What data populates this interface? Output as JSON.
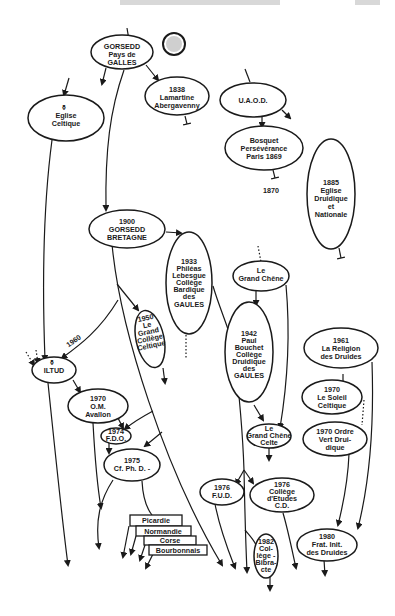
{
  "diagram": {
    "nodes": {
      "gorsedd_galles": {
        "lines": [
          "GORSEDD",
          "Pays de",
          "GALLES"
        ]
      },
      "lamartine": {
        "lines": [
          "1838",
          "Lamartine",
          "Abergavenny"
        ]
      },
      "uaod": {
        "lines": [
          "U.A.O.D."
        ]
      },
      "eglise_celtique": {
        "lines": [
          "Eglise",
          "Celtique"
        ],
        "symbol": "⚱"
      },
      "bosquet": {
        "lines": [
          "Bosquet",
          "Persévérance",
          "Paris 1869"
        ]
      },
      "label_1870": {
        "text": "1870"
      },
      "eglise_druidique": {
        "lines": [
          "1885",
          "Eglise",
          "Druidique",
          "et",
          "Nationale"
        ]
      },
      "gorsedd_bretagne": {
        "lines": [
          "1900",
          "GORSEDD",
          "BRETAGNE"
        ]
      },
      "phileas": {
        "lines": [
          "1933",
          "Philéas",
          "Lebesgue",
          "Collège",
          "Bardique",
          "des",
          "GAULES"
        ]
      },
      "grand_chene": {
        "lines": [
          "Le",
          "Grand Chêne"
        ]
      },
      "grand_college": {
        "lines": [
          "1950",
          "Le",
          "Grand",
          "Collège",
          "Celtique"
        ]
      },
      "label_1960": {
        "text": "1960"
      },
      "iltud": {
        "lines": [
          "ILTUD"
        ],
        "symbol": "⚱"
      },
      "paul_bouchet": {
        "lines": [
          "1942",
          "Paul",
          "Bouchet",
          "Collège",
          "Druidique",
          "des",
          "GAULES"
        ]
      },
      "religion_druides": {
        "lines": [
          "1961",
          "La Religion",
          "des Druides"
        ]
      },
      "om_avallon": {
        "lines": [
          "1970",
          "O.M.",
          "Avallon"
        ]
      },
      "soleil_celtique": {
        "lines": [
          "1970",
          "Le Soleil",
          "Celtique"
        ]
      },
      "fdo": {
        "lines": [
          "1974",
          "F.D.O."
        ]
      },
      "grand_chene_celte": {
        "lines": [
          "Le",
          "Grand Chêne",
          "Celte"
        ]
      },
      "ordre_vert": {
        "lines": [
          "1970 Ordre",
          "Vert Drui-",
          "dique"
        ]
      },
      "cf_ph_d": {
        "lines": [
          "1975",
          "Cf. Ph. D. -"
        ]
      },
      "fud": {
        "lines": [
          "1976",
          "F.U.D."
        ]
      },
      "college_etudes": {
        "lines": [
          "1976",
          "Collège",
          "d'Etudes",
          "C.D."
        ]
      },
      "frat_init": {
        "lines": [
          "1980",
          "Frat. Init.",
          "des Druides"
        ]
      },
      "college_bibracte": {
        "lines": [
          "1982",
          "Col-",
          "lège -",
          "Bibra-",
          "cte"
        ]
      }
    },
    "regional_boxes": [
      "Picardie",
      "Normandie",
      "Corse",
      "Bourbonnais"
    ],
    "colors": {
      "ink": "#1a1a1a",
      "paper": "#ffffff"
    }
  }
}
